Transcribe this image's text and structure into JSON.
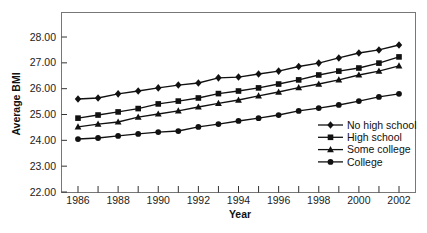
{
  "chart_data": {
    "type": "line",
    "title": "",
    "xlabel": "Year",
    "ylabel": "Average BMI",
    "x": [
      1986,
      1987,
      1988,
      1989,
      1990,
      1991,
      1992,
      1993,
      1994,
      1995,
      1996,
      1997,
      1998,
      1999,
      2000,
      2001,
      2002
    ],
    "xticks": [
      "1986",
      "1988",
      "1990",
      "1992",
      "1994",
      "1996",
      "1998",
      "2000",
      "2002"
    ],
    "yticks": [
      "22.00",
      "23.00",
      "24.00",
      "25.00",
      "26.00",
      "27.00",
      "28.00"
    ],
    "ylim": [
      22,
      29
    ],
    "xlim": [
      1985.2,
      2002.8
    ],
    "grid": false,
    "legend_position": "lower right (inside)",
    "series": [
      {
        "name": "No high school",
        "marker": "diamond",
        "values": [
          25.6,
          25.64,
          25.8,
          25.91,
          26.03,
          26.14,
          26.22,
          26.42,
          26.45,
          26.57,
          26.68,
          26.86,
          26.99,
          27.19,
          27.38,
          27.5,
          27.69
        ]
      },
      {
        "name": "High school",
        "marker": "square",
        "values": [
          24.86,
          24.98,
          25.1,
          25.23,
          25.41,
          25.52,
          25.64,
          25.81,
          25.91,
          26.03,
          26.18,
          26.34,
          26.53,
          26.68,
          26.8,
          26.99,
          27.23
        ]
      },
      {
        "name": "Some college",
        "marker": "triangle",
        "values": [
          24.52,
          24.63,
          24.71,
          24.9,
          25.02,
          25.14,
          25.29,
          25.43,
          25.56,
          25.72,
          25.87,
          26.04,
          26.18,
          26.34,
          26.53,
          26.68,
          26.88
        ]
      },
      {
        "name": "College",
        "marker": "circle",
        "values": [
          24.05,
          24.09,
          24.17,
          24.25,
          24.32,
          24.36,
          24.52,
          24.63,
          24.75,
          24.86,
          24.98,
          25.14,
          25.25,
          25.37,
          25.52,
          25.68,
          25.8
        ]
      }
    ]
  },
  "axes": {
    "x_title": "Year",
    "y_title": "Average BMI"
  },
  "legend": {
    "items": [
      {
        "label": "No high school",
        "marker": "diamond"
      },
      {
        "label": "High school",
        "marker": "square"
      },
      {
        "label": "Some college",
        "marker": "triangle"
      },
      {
        "label": "College",
        "marker": "circle"
      }
    ]
  },
  "colors": {
    "line": "#111111",
    "frame": "#777777",
    "text": "#222222",
    "background": "#ffffff"
  }
}
